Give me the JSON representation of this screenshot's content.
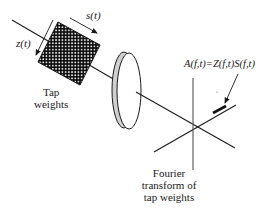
{
  "diagram": {
    "labels": {
      "s_t": "s(t)",
      "z_t": "z(t)",
      "tap_weights_line1": "Tap",
      "tap_weights_line2": "weights",
      "equation": "A(f,t)=Z(f,t)S(f,t)",
      "fourier_line1": "Fourier",
      "fourier_line2": "transform of",
      "fourier_line3": "tap weights"
    },
    "components": [
      "tap-weight-grid",
      "lens",
      "frequency-time-axes",
      "output-arrow"
    ],
    "colors": {
      "ink": "#1a1a1a",
      "lens_edge": "#cccccc",
      "background": "#ffffff"
    }
  }
}
